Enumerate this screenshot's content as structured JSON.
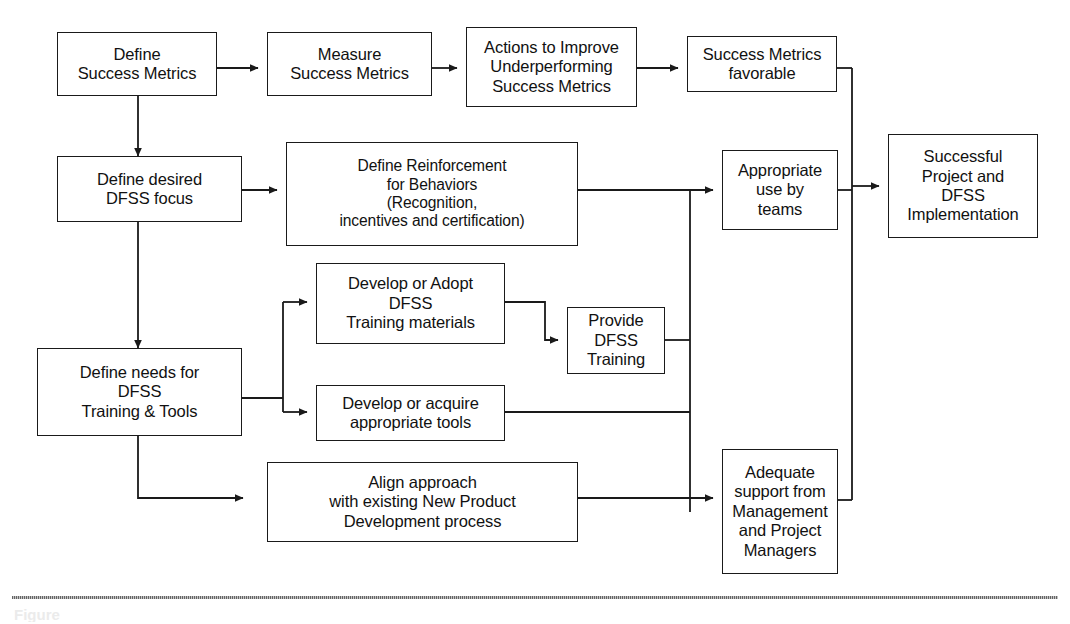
{
  "figure": {
    "caption": "Figure",
    "divider": "dotted-rule"
  },
  "nodes": [
    {
      "id": "define-success-metrics",
      "label": "Define\nSuccess Metrics"
    },
    {
      "id": "measure-success-metrics",
      "label": "Measure\nSuccess Metrics"
    },
    {
      "id": "actions-to-improve",
      "label": "Actions to Improve\nUnderperforming\nSuccess Metrics"
    },
    {
      "id": "success-metrics-favorable",
      "label": "Success Metrics\nfavorable"
    },
    {
      "id": "successful-project",
      "label": "Successful\nProject and\nDFSS\nImplementation"
    },
    {
      "id": "define-desired-dfss-focus",
      "label": "Define desired\nDFSS focus"
    },
    {
      "id": "define-reinforcement",
      "label": "Define Reinforcement\nfor Behaviors\n(Recognition,\nincentives and certification)"
    },
    {
      "id": "appropriate-use-by-teams",
      "label": "Appropriate\nuse by\nteams"
    },
    {
      "id": "develop-or-adopt-training",
      "label": "Develop or Adopt\nDFSS\nTraining materials"
    },
    {
      "id": "provide-dfss-training",
      "label": "Provide\nDFSS\nTraining"
    },
    {
      "id": "define-needs-for-dfss",
      "label": "Define needs for\nDFSS\nTraining & Tools"
    },
    {
      "id": "develop-or-acquire-tools",
      "label": "Develop or acquire\nappropriate tools"
    },
    {
      "id": "align-approach",
      "label": "Align approach\nwith existing New Product\nDevelopment process"
    },
    {
      "id": "adequate-support",
      "label": "Adequate\nsupport from\nManagement\nand Project\nManagers"
    }
  ],
  "edges": [
    {
      "from": "define-success-metrics",
      "to": "measure-success-metrics"
    },
    {
      "from": "measure-success-metrics",
      "to": "actions-to-improve"
    },
    {
      "from": "actions-to-improve",
      "to": "success-metrics-favorable"
    },
    {
      "from": "success-metrics-favorable",
      "to": "successful-project"
    },
    {
      "from": "define-success-metrics",
      "to": "define-desired-dfss-focus"
    },
    {
      "from": "define-desired-dfss-focus",
      "to": "define-reinforcement"
    },
    {
      "from": "define-desired-dfss-focus",
      "to": "define-needs-for-dfss"
    },
    {
      "from": "define-reinforcement",
      "to": "appropriate-use-by-teams"
    },
    {
      "from": "define-needs-for-dfss",
      "to": "develop-or-adopt-training"
    },
    {
      "from": "define-needs-for-dfss",
      "to": "develop-or-acquire-tools"
    },
    {
      "from": "define-needs-for-dfss",
      "to": "align-approach"
    },
    {
      "from": "develop-or-adopt-training",
      "to": "provide-dfss-training"
    },
    {
      "from": "provide-dfss-training",
      "to": "appropriate-use-by-teams"
    },
    {
      "from": "develop-or-acquire-tools",
      "to": "adequate-support"
    },
    {
      "from": "align-approach",
      "to": "adequate-support"
    },
    {
      "from": "appropriate-use-by-teams",
      "to": "successful-project"
    },
    {
      "from": "adequate-support",
      "to": "successful-project"
    }
  ],
  "colors": {
    "stroke": "#1a1a1a",
    "background": "#ffffff",
    "text": "#111111"
  }
}
